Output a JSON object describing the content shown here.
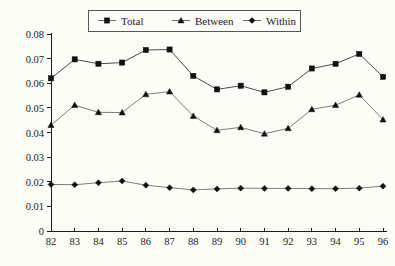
{
  "chart_data": {
    "type": "line",
    "title": "",
    "subtitle": "",
    "xlabel": "",
    "ylabel": "",
    "x": [
      "82",
      "83",
      "84",
      "85",
      "86",
      "87",
      "88",
      "89",
      "90",
      "91",
      "92",
      "93",
      "94",
      "95",
      "96"
    ],
    "categories": [
      "82",
      "83",
      "84",
      "85",
      "86",
      "87",
      "88",
      "89",
      "90",
      "91",
      "92",
      "93",
      "94",
      "95",
      "96"
    ],
    "series": [
      {
        "name": "Total",
        "marker": "square",
        "values": [
          0.062,
          0.0697,
          0.0679,
          0.0684,
          0.0735,
          0.0737,
          0.063,
          0.0575,
          0.059,
          0.0563,
          0.0586,
          0.066,
          0.0679,
          0.0719,
          0.0626
        ]
      },
      {
        "name": "Between",
        "marker": "triangle",
        "values": [
          0.043,
          0.0511,
          0.0482,
          0.0481,
          0.0555,
          0.0566,
          0.0467,
          0.0409,
          0.0421,
          0.0395,
          0.0417,
          0.0494,
          0.0511,
          0.0553,
          0.0452
        ]
      },
      {
        "name": "Within",
        "marker": "diamond",
        "values": [
          0.0189,
          0.0188,
          0.0196,
          0.0203,
          0.0186,
          0.0176,
          0.0167,
          0.0171,
          0.0174,
          0.0173,
          0.0173,
          0.0172,
          0.0172,
          0.0174,
          0.0182
        ]
      }
    ],
    "ylim": [
      0,
      0.08
    ],
    "ytick_labels": [
      "0.08",
      "0.07",
      "0.06",
      "0.05",
      "0.04",
      "0.03",
      "0.02",
      "0.01",
      "0"
    ],
    "ytick_values": [
      0.08,
      0.07,
      0.06,
      0.05,
      0.04,
      0.03,
      0.02,
      0.01,
      0
    ],
    "grid": false,
    "legend_position": "top-center",
    "legend_entries": [
      "Total",
      "Between",
      "Within"
    ],
    "colors": {
      "line": "#7d7d78",
      "line_total": "#4a4a46",
      "marker": "#101010",
      "axis": "#1a1a1a",
      "background": "#fdfdf8"
    }
  }
}
